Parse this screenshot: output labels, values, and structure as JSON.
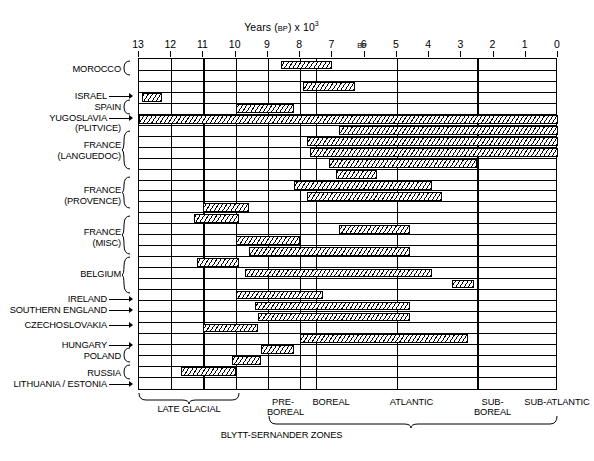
{
  "chart_data": {
    "type": "bar",
    "xlabel": "Years (BP) x 10³",
    "ylabel": "",
    "xlim": [
      13,
      0
    ],
    "x_ticks": [
      13,
      12,
      11,
      10,
      9,
      8,
      7,
      6,
      5,
      4,
      3,
      2,
      1,
      0
    ],
    "x_tick_labels": [
      "13",
      "12",
      "11",
      "10",
      "9",
      "8",
      "7",
      "6",
      "5",
      "4",
      "3",
      "2",
      "1",
      "0"
    ],
    "bp_marker_label": "BP",
    "grid": true,
    "legend": false,
    "orientation": "horizontal-range-bars",
    "note": "Horizontal hatched range bars; x values are thousands of years Before Present, axis reversed (13 at left, 0 at right).",
    "categories": [
      "MOROCCO",
      "ISRAEL",
      "SPAIN",
      "YUGOSLAVIA (PLITVICE)",
      "FRANCE (LANGUEDOC)",
      "FRANCE (PROVENCE)",
      "FRANCE (MISC)",
      "BELGIUM",
      "IRELAND",
      "SOUTHERN ENGLAND",
      "CZECHOSLOVAKIA",
      "HUNGARY",
      "POLAND",
      "RUSSIA",
      "LITHUANIA / ESTONIA"
    ],
    "bars": [
      {
        "row": 1,
        "group": "MOROCCO",
        "start": 8.6,
        "end": 7.0,
        "style": "hatch"
      },
      {
        "row": 2,
        "group": "MOROCCO",
        "start": null,
        "end": null,
        "style": "none"
      },
      {
        "row": 3,
        "group": "ISRAEL",
        "start": 7.9,
        "end": 6.3,
        "style": "hatch"
      },
      {
        "row": 4,
        "group": "SPAIN",
        "start": 12.9,
        "end": 12.3,
        "style": "hatch"
      },
      {
        "row": 5,
        "group": "SPAIN",
        "start": 10.0,
        "end": 8.2,
        "style": "hatch"
      },
      {
        "row": 6,
        "group": "YUGOSLAVIA (PLITVICE)",
        "start": 13.0,
        "end": 0.0,
        "style": "hatch"
      },
      {
        "row": 7,
        "group": "FRANCE (LANGUEDOC)",
        "start": 6.8,
        "end": 0.0,
        "style": "hatch"
      },
      {
        "row": 8,
        "group": "FRANCE (LANGUEDOC)",
        "start": 7.8,
        "end": 0.0,
        "style": "hatch"
      },
      {
        "row": 9,
        "group": "FRANCE (LANGUEDOC)",
        "start": 7.7,
        "end": 0.0,
        "style": "hatch"
      },
      {
        "row": 10,
        "group": "FRANCE (LANGUEDOC)",
        "start": 7.1,
        "end": 2.5,
        "style": "hatch"
      },
      {
        "row": 11,
        "group": "FRANCE (PROVENCE)",
        "start": 6.9,
        "end": 5.6,
        "style": "hatch"
      },
      {
        "row": 12,
        "group": "FRANCE (PROVENCE)",
        "start": 8.2,
        "end": 3.9,
        "style": "hatch"
      },
      {
        "row": 13,
        "group": "FRANCE (PROVENCE)",
        "start": 7.8,
        "end": 3.6,
        "style": "hatch"
      },
      {
        "row": 14,
        "group": "FRANCE (MISC)",
        "start": 11.0,
        "end": 9.6,
        "style": "hatch"
      },
      {
        "row": 15,
        "group": "FRANCE (MISC)",
        "start": 11.3,
        "end": 9.9,
        "style": "hatch"
      },
      {
        "row": 16,
        "group": "FRANCE (MISC)",
        "start": 6.8,
        "end": 4.6,
        "style": "hatch"
      },
      {
        "row": 17,
        "group": "BELGIUM",
        "start": 10.0,
        "end": 8.0,
        "style": "hatch"
      },
      {
        "row": 18,
        "group": "BELGIUM",
        "start": 9.6,
        "end": 4.6,
        "style": "hatch"
      },
      {
        "row": 19,
        "group": "BELGIUM",
        "start": 11.2,
        "end": 9.9,
        "style": "hatch"
      },
      {
        "row": 20,
        "group": "BELGIUM",
        "start": 9.7,
        "end": 3.9,
        "style": "hatch"
      },
      {
        "row": 21,
        "group": "IRELAND",
        "start": 3.3,
        "end": 2.6,
        "style": "hatch"
      },
      {
        "row": 22,
        "group": "SOUTHERN ENGLAND",
        "start": 10.0,
        "end": 7.3,
        "style": "hatch"
      },
      {
        "row": 23,
        "group": "CZECHOSLOVAKIA",
        "start": 9.4,
        "end": 4.6,
        "style": "hatch"
      },
      {
        "row": 24,
        "group": "CZECHOSLOVAKIA",
        "start": 9.3,
        "end": 4.6,
        "style": "hatch"
      },
      {
        "row": 25,
        "group": "HUNGARY",
        "start": 11.0,
        "end": 9.3,
        "style": "hatch"
      },
      {
        "row": 26,
        "group": "POLAND",
        "start": 8.0,
        "end": 2.8,
        "style": "hatch"
      },
      {
        "row": 27,
        "group": "POLAND",
        "start": 9.2,
        "end": 8.2,
        "style": "hatch"
      },
      {
        "row": 28,
        "group": "RUSSIA",
        "start": 10.1,
        "end": 9.2,
        "style": "hatch"
      },
      {
        "row": 29,
        "group": "LITHUANIA / ESTONIA",
        "start": 11.7,
        "end": 10.0,
        "style": "hatch"
      }
    ],
    "zones": [
      {
        "label": "LATE GLACIAL",
        "start": 13.0,
        "end": 10.0,
        "tier": "upper-group"
      },
      {
        "label": "PRE-BOREAL",
        "start": 10.0,
        "end": 9.0,
        "tier": "blytt"
      },
      {
        "label": "BOREAL",
        "start": 9.0,
        "end": 7.5,
        "tier": "blytt"
      },
      {
        "label": "ATLANTIC",
        "start": 7.5,
        "end": 5.0,
        "tier": "blytt"
      },
      {
        "label": "SUB-BOREAL",
        "start": 5.0,
        "end": 2.5,
        "tier": "blytt"
      },
      {
        "label": "SUB-ATLANTIC",
        "start": 2.5,
        "end": 0.0,
        "tier": "blytt"
      }
    ],
    "zone_group_label": "BLYTT-SERNANDER ZONES"
  },
  "axis": {
    "title_main": "Years",
    "title_bp": "BP",
    "title_mult": "x 10",
    "title_exp": "3",
    "ticks": [
      "13",
      "12",
      "11",
      "10",
      "9",
      "8",
      "7",
      "6",
      "5",
      "4",
      "3",
      "2",
      "1",
      "0"
    ],
    "bp_label": "BP"
  },
  "labels": {
    "morocco": "MOROCCO",
    "israel": "ISRAEL",
    "spain": "SPAIN",
    "yugoslavia": "YUGOSLAVIA",
    "yugoslavia_sub": "(PLITVICE)",
    "france1": "FRANCE",
    "france1_sub": "(LANGUEDOC)",
    "france2": "FRANCE",
    "france2_sub": "(PROVENCE)",
    "france3": "FRANCE",
    "france3_sub": "(MISC)",
    "belgium": "BELGIUM",
    "ireland": "IRELAND",
    "southern_england": "SOUTHERN ENGLAND",
    "czechoslovakia": "CZECHOSLOVAKIA",
    "hungary": "HUNGARY",
    "poland": "POLAND",
    "russia": "RUSSIA",
    "lithuania_estonia": "LITHUANIA / ESTONIA"
  },
  "zones": {
    "late_glacial": "LATE GLACIAL",
    "pre": "PRE-",
    "boreal_pre": "BOREAL",
    "boreal": "BOREAL",
    "atlantic": "ATLANTIC",
    "sub": "SUB-",
    "boreal_sub": "BOREAL",
    "sub_atlantic": "SUB-ATLANTIC",
    "blytt_sernander": "BLYTT-SERNANDER ZONES"
  },
  "colors": {
    "ink": "#000000",
    "paper": "#ffffff"
  }
}
